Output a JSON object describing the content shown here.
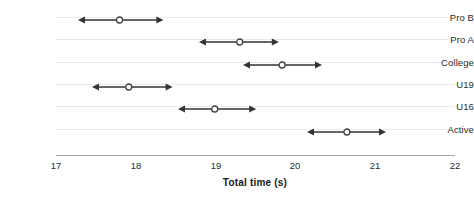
{
  "chart_data": {
    "type": "scatter",
    "title": "",
    "subtitle": "",
    "xlabel": "Total time (s)",
    "ylabel": "",
    "xlim": [
      17,
      22
    ],
    "ylim": [
      0,
      6
    ],
    "grid": true,
    "legend_position": "none",
    "orientation": "horizontal",
    "marker": "open-circle",
    "error_bar_style": "double-headed-arrow",
    "xticks": [
      17,
      18,
      19,
      20,
      21,
      22
    ],
    "xtick_labels": [
      "17",
      "18",
      "19",
      "20",
      "21",
      "22"
    ],
    "categories": [
      "Pro B",
      "Pro A",
      "College",
      "U19",
      "U16",
      "Active"
    ],
    "series": [
      {
        "name": "Total time",
        "values": [
          17.8,
          19.3,
          19.83,
          17.91,
          18.99,
          20.64
        ],
        "low": [
          17.28,
          18.79,
          19.34,
          17.45,
          18.53,
          20.14
        ],
        "high": [
          18.35,
          19.79,
          20.33,
          18.46,
          19.51,
          21.13
        ]
      }
    ],
    "points": [
      {
        "category": "Pro B",
        "value": 17.8,
        "low": 17.28,
        "high": 18.35
      },
      {
        "category": "Pro A",
        "value": 19.3,
        "low": 18.79,
        "high": 19.79
      },
      {
        "category": "College",
        "value": 19.83,
        "low": 19.34,
        "high": 20.33
      },
      {
        "category": "U19",
        "value": 17.91,
        "low": 17.45,
        "high": 18.46
      },
      {
        "category": "U16",
        "value": 18.99,
        "low": 18.53,
        "high": 19.51
      },
      {
        "category": "Active",
        "value": 20.64,
        "low": 20.14,
        "high": 21.13
      }
    ],
    "colors": {
      "arrow": "#333333",
      "marker_stroke": "#404040",
      "marker_fill": "#ffffff",
      "gridline": "#e9e9e9",
      "axis": "#a6a6a6",
      "text": "#2b2b2b"
    }
  }
}
